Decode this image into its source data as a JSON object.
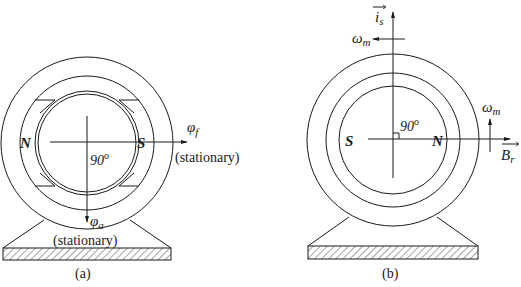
{
  "figure_a": {
    "caption": "(a)",
    "pole_left": "N",
    "pole_right": "S",
    "angle_label": "90",
    "angle_unit": "o",
    "field_flux_symbol": "φ",
    "field_flux_sub": "f",
    "field_flux_state": "(stationary)",
    "armature_flux_symbol": "φ",
    "armature_flux_sub": "a",
    "armature_flux_state": "(stationary)"
  },
  "figure_b": {
    "caption": "(b)",
    "pole_left": "S",
    "pole_right": "N",
    "angle_label": "90",
    "angle_unit": "o",
    "stator_current_symbol": "i",
    "stator_current_sub": "s",
    "rotor_field_symbol": "B",
    "rotor_field_sub": "r",
    "speed_symbol_top": "ω",
    "speed_sub_top": "m",
    "speed_symbol_right": "ω",
    "speed_sub_right": "m"
  },
  "colors": {
    "line": "#1a1a1a",
    "background": "#ffffff"
  }
}
